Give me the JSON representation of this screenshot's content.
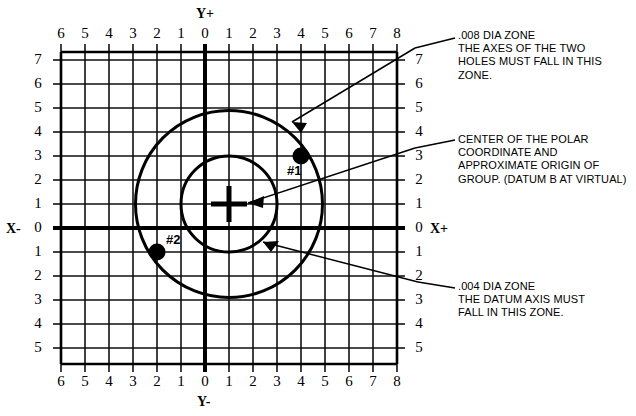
{
  "figure": {
    "axes": {
      "top_label": "Y+",
      "bottom_label": "Y-",
      "left_label": "X-",
      "right_label": "X+",
      "horizontal_ticks": [
        "6",
        "5",
        "4",
        "3",
        "2",
        "1",
        "0",
        "1",
        "2",
        "3",
        "4",
        "5",
        "6",
        "7",
        "8"
      ],
      "vertical_ticks": [
        "7",
        "6",
        "5",
        "4",
        "3",
        "2",
        "1",
        "0",
        "1",
        "2",
        "3",
        "4",
        "5"
      ],
      "x_range": [
        -6,
        8
      ],
      "y_range": [
        -5,
        7
      ]
    },
    "holes": [
      {
        "label": "#1",
        "x": 4,
        "y": 3
      },
      {
        "label": "#2",
        "x": -2,
        "y": -1
      }
    ],
    "center_marker": {
      "name": "polar-coordinate-center",
      "x": 1,
      "y": 1
    },
    "zones": [
      {
        "name": "outer-tolerance-zone",
        "center_x": 1,
        "center_y": 1,
        "radius": 3.9,
        "label": ".008 DIA ZONE"
      },
      {
        "name": "inner-tolerance-zone",
        "center_x": 1,
        "center_y": 1,
        "radius": 2.0,
        "label": ".004 DIA ZONE"
      }
    ],
    "notes": [
      {
        "id": "note-008-zone",
        "text": ".008 DIA ZONE\nTHE AXES OF THE TWO\nHOLES MUST FALL IN THIS\nZONE."
      },
      {
        "id": "note-polar-center",
        "text": "CENTER OF THE POLAR\nCOORDINATE AND\nAPPROXIMATE ORIGIN OF\nGROUP. (DATUM B AT VIRTUAL)"
      },
      {
        "id": "note-004-zone",
        "text": ".004 DIA ZONE\nTHE DATUM AXIS MUST\nFALL IN THIS ZONE."
      }
    ],
    "colors": {
      "ink": "#000000",
      "grid": "#1a1a1a",
      "background": "#ffffff"
    }
  }
}
